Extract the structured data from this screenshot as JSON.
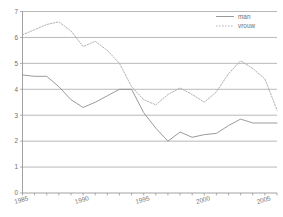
{
  "chart_data": {
    "type": "line",
    "title": "",
    "xlabel": "",
    "ylabel": "",
    "xlim": [
      1985,
      2006
    ],
    "ylim": [
      0,
      7
    ],
    "grid": true,
    "legend_position": "top-right",
    "y_ticks": [
      "0",
      "1",
      "2",
      "3",
      "4",
      "5",
      "6",
      "7"
    ],
    "y_tick_values": [
      0,
      1,
      2,
      3,
      4,
      5,
      6,
      7
    ],
    "x_ticks": [
      "1985",
      "1990",
      "1995",
      "2000",
      "2005"
    ],
    "x_tick_values": [
      1985,
      1990,
      1995,
      2000,
      2005
    ],
    "x_minor_ticks": [
      1986,
      1987,
      1988,
      1989,
      1991,
      1992,
      1993,
      1994,
      1996,
      1997,
      1998,
      1999,
      2001,
      2002,
      2003,
      2004,
      2006
    ],
    "x": [
      1985,
      1986,
      1987,
      1988,
      1989,
      1990,
      1991,
      1992,
      1993,
      1994,
      1995,
      1996,
      1997,
      1998,
      1999,
      2000,
      2001,
      2002,
      2003,
      2004,
      2005,
      2006
    ],
    "series": [
      {
        "name": "man",
        "style": "solid",
        "color": "#8f8f8f",
        "values": [
          4.55,
          4.5,
          4.5,
          4.1,
          3.6,
          3.3,
          3.5,
          3.75,
          4.0,
          4.0,
          3.1,
          2.5,
          2.0,
          2.35,
          2.15,
          2.25,
          2.3,
          2.6,
          2.85,
          2.7,
          2.7,
          2.7
        ]
      },
      {
        "name": "vrouw",
        "style": "dotted",
        "color": "#a8a8a8",
        "values": [
          6.1,
          6.3,
          6.5,
          6.6,
          6.25,
          5.65,
          5.85,
          5.5,
          5.0,
          4.1,
          3.6,
          3.4,
          3.8,
          4.05,
          3.8,
          3.5,
          3.9,
          4.6,
          5.1,
          4.8,
          4.4,
          3.2
        ]
      }
    ]
  },
  "legend": {
    "entries": [
      {
        "label": "man"
      },
      {
        "label": "vrouw"
      }
    ]
  }
}
